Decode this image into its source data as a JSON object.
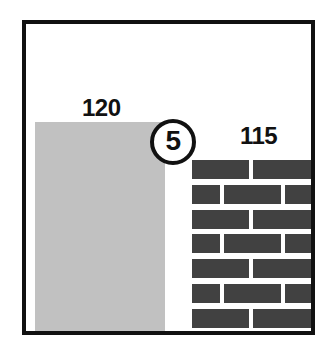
{
  "figure": {
    "frame": {
      "border_color": "#111111"
    }
  },
  "labels": {
    "block_wall_thickness": "120",
    "brick_wall_thickness": "115",
    "callout_number": "5"
  },
  "elements": {
    "block_wall": {
      "name": "block-wall",
      "label": "120",
      "color": "#c1c1c1"
    },
    "brick_wall": {
      "name": "brick-wall",
      "label": "115",
      "brick_color": "#414141",
      "mortar_color": "#ffffff",
      "rows": 7
    },
    "cavity_gap": {
      "name": "cavity-gap",
      "color": "#ffffff"
    },
    "callout": {
      "name": "callout-marker",
      "number": "5",
      "shape": "circle",
      "outline_color": "#111111",
      "fill_color": "#ffffff"
    }
  },
  "brick_rows": [
    {
      "offset": 0,
      "bricks": [
        {
          "x": 0,
          "w": 57
        },
        {
          "x": 61,
          "w": 62
        }
      ]
    },
    {
      "offset": 25,
      "bricks": [
        {
          "x": 0,
          "w": 28
        },
        {
          "x": 32,
          "w": 57
        },
        {
          "x": 93,
          "w": 30
        }
      ]
    },
    {
      "offset": 50,
      "bricks": [
        {
          "x": 0,
          "w": 57
        },
        {
          "x": 61,
          "w": 62
        }
      ]
    },
    {
      "offset": 74,
      "bricks": [
        {
          "x": 0,
          "w": 28
        },
        {
          "x": 32,
          "w": 57
        },
        {
          "x": 93,
          "w": 30
        }
      ]
    },
    {
      "offset": 99,
      "bricks": [
        {
          "x": 0,
          "w": 57
        },
        {
          "x": 61,
          "w": 62
        }
      ]
    },
    {
      "offset": 124,
      "bricks": [
        {
          "x": 0,
          "w": 28
        },
        {
          "x": 32,
          "w": 57
        },
        {
          "x": 93,
          "w": 30
        }
      ]
    },
    {
      "offset": 149,
      "bricks": [
        {
          "x": 0,
          "w": 57
        },
        {
          "x": 61,
          "w": 62
        }
      ]
    }
  ]
}
